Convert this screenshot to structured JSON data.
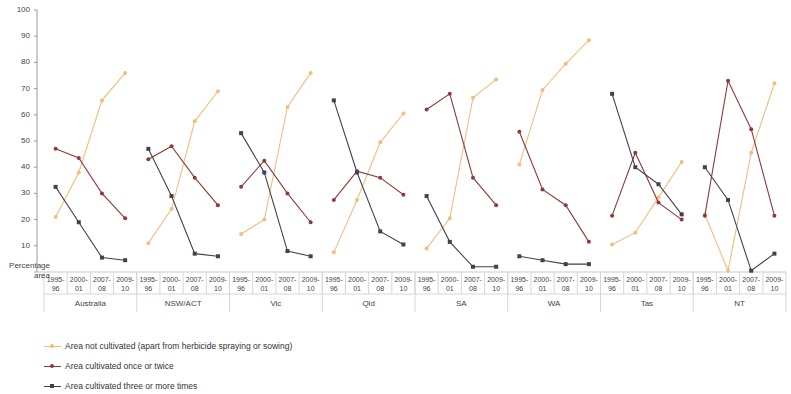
{
  "chart_data": {
    "type": "line",
    "title": "",
    "xlabel": "",
    "ylabel": "Percentage area",
    "ylim": [
      0,
      100
    ],
    "ytick_step": 10,
    "grid": false,
    "legend_position": "bottom-left",
    "categories": [
      "1995-96",
      "2000-01",
      "2007-08",
      "2009-10"
    ],
    "category_lines": [
      [
        "1995-",
        "96"
      ],
      [
        "2000-",
        "01"
      ],
      [
        "2007-",
        "08"
      ],
      [
        "2009-",
        "10"
      ]
    ],
    "groups": [
      "Australia",
      "NSW/ACT",
      "Vic",
      "Qld",
      "SA",
      "WA",
      "Tas",
      "NT"
    ],
    "series": [
      {
        "name": "Area not cultivated (apart from herbicide spraying or sowing)",
        "color": "#F0BE7E",
        "values_by_group": {
          "Australia": [
            21,
            38,
            65.5,
            76
          ],
          "NSW/ACT": [
            11,
            24,
            57.5,
            69
          ],
          "Vic": [
            14.5,
            20,
            63,
            76
          ],
          "Qld": [
            7.5,
            27.5,
            49.5,
            60.5
          ],
          "SA": [
            9,
            20.5,
            66.5,
            73.5
          ],
          "WA": [
            41,
            69.5,
            79.5,
            88.5
          ],
          "Tas": [
            10.5,
            15,
            28.5,
            42
          ],
          "NT": [
            22,
            0.5,
            45.5,
            72
          ]
        }
      },
      {
        "name": "Area cultivated once or twice",
        "color": "#8C3B38",
        "values_by_group": {
          "Australia": [
            47,
            43.5,
            30,
            20.5
          ],
          "NSW/ACT": [
            43,
            48,
            36,
            25.5
          ],
          "Vic": [
            32.5,
            42.5,
            30,
            19
          ],
          "Qld": [
            27.5,
            38.5,
            36,
            29.5
          ],
          "SA": [
            62,
            68,
            36,
            25.5
          ],
          "WA": [
            53.5,
            31.5,
            25.5,
            11.5
          ],
          "Tas": [
            21.5,
            45.5,
            26.5,
            20
          ],
          "NT": [
            21.5,
            73,
            54.5,
            21.5
          ]
        }
      },
      {
        "name": "Area cultivated three or more times",
        "color": "#42414F",
        "values_by_group": {
          "Australia": [
            32.5,
            19,
            5.5,
            4.5
          ],
          "NSW/ACT": [
            47,
            29,
            7,
            6
          ],
          "Vic": [
            53,
            38,
            8,
            6
          ],
          "Qld": [
            65.5,
            38,
            15.5,
            10.5
          ],
          "SA": [
            29,
            11.5,
            2,
            2
          ],
          "WA": [
            6,
            4.5,
            3,
            3
          ],
          "Tas": [
            68,
            40,
            33.5,
            22
          ],
          "NT": [
            40,
            27.5,
            0.5,
            7
          ]
        }
      }
    ]
  }
}
